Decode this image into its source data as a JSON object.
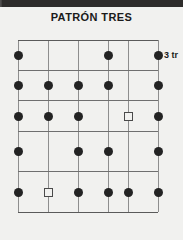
{
  "title": "PATRÓN TRES",
  "fret_label": "3 tr",
  "diagram": {
    "type": "guitar-fretboard",
    "strings": 6,
    "frets": 5,
    "string_x": [
      0,
      30,
      60,
      90,
      110,
      140
    ],
    "fret_y": [
      0,
      30,
      60,
      91,
      131,
      172
    ],
    "colors": {
      "background": "#f1f1ef",
      "header_band": "#2e2c2b",
      "string_line": "#8e8e8e",
      "fret_line": "#6f6f6f",
      "dot_fill": "#232323",
      "square_outline": "#4a4a4a",
      "title_text": "#1b1b1b"
    },
    "markers": [
      {
        "row": 1,
        "string": 1,
        "shape": "dot"
      },
      {
        "row": 1,
        "string": 4,
        "shape": "dot"
      },
      {
        "row": 1,
        "string": 6,
        "shape": "dot"
      },
      {
        "row": 2,
        "string": 1,
        "shape": "dot"
      },
      {
        "row": 2,
        "string": 2,
        "shape": "dot"
      },
      {
        "row": 2,
        "string": 3,
        "shape": "dot"
      },
      {
        "row": 2,
        "string": 4,
        "shape": "dot"
      },
      {
        "row": 2,
        "string": 6,
        "shape": "dot"
      },
      {
        "row": 3,
        "string": 1,
        "shape": "dot"
      },
      {
        "row": 3,
        "string": 2,
        "shape": "dot"
      },
      {
        "row": 3,
        "string": 3,
        "shape": "dot"
      },
      {
        "row": 3,
        "string": 5,
        "shape": "square"
      },
      {
        "row": 3,
        "string": 6,
        "shape": "dot"
      },
      {
        "row": 4,
        "string": 1,
        "shape": "dot"
      },
      {
        "row": 4,
        "string": 3,
        "shape": "dot"
      },
      {
        "row": 4,
        "string": 4,
        "shape": "dot"
      },
      {
        "row": 4,
        "string": 6,
        "shape": "dot"
      },
      {
        "row": 5,
        "string": 1,
        "shape": "dot"
      },
      {
        "row": 5,
        "string": 2,
        "shape": "square"
      },
      {
        "row": 5,
        "string": 3,
        "shape": "dot"
      },
      {
        "row": 5,
        "string": 4,
        "shape": "dot"
      },
      {
        "row": 5,
        "string": 5,
        "shape": "dot"
      },
      {
        "row": 5,
        "string": 6,
        "shape": "dot"
      }
    ]
  }
}
